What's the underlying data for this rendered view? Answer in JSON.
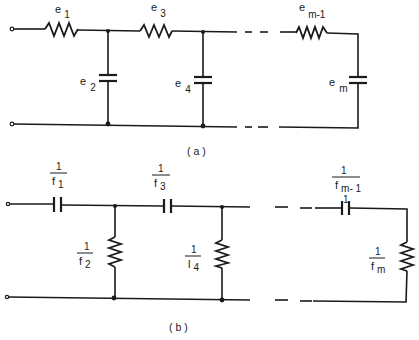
{
  "figure": {
    "part_a": {
      "caption": "( a )",
      "description": "Ladder network: series resistors, shunt capacitors",
      "elements": [
        {
          "id": "e1",
          "type": "resistor",
          "position": "series",
          "symbol": "e",
          "subscript": "1"
        },
        {
          "id": "e2",
          "type": "capacitor",
          "position": "shunt",
          "symbol": "e",
          "subscript": "2"
        },
        {
          "id": "e3",
          "type": "resistor",
          "position": "series",
          "symbol": "e",
          "subscript": "3"
        },
        {
          "id": "e4",
          "type": "capacitor",
          "position": "shunt",
          "symbol": "e",
          "subscript": "4"
        },
        {
          "id": "em-1",
          "type": "resistor",
          "position": "series",
          "symbol": "e",
          "subscript": "m-1"
        },
        {
          "id": "em",
          "type": "capacitor",
          "position": "shunt",
          "symbol": "e",
          "subscript": "m"
        }
      ]
    },
    "part_b": {
      "caption": "( b )",
      "description": "Dual ladder network: series capacitors, shunt resistors",
      "elements": [
        {
          "id": "f1",
          "type": "capacitor",
          "position": "series",
          "numerator": "1",
          "symbol": "f",
          "subscript": "1"
        },
        {
          "id": "f2",
          "type": "resistor",
          "position": "shunt",
          "numerator": "1",
          "symbol": "f",
          "subscript": "2"
        },
        {
          "id": "f3",
          "type": "capacitor",
          "position": "series",
          "numerator": "1",
          "symbol": "f",
          "subscript": "3"
        },
        {
          "id": "f4",
          "type": "resistor",
          "position": "shunt",
          "numerator": "1",
          "symbol": "l",
          "subscript": "4"
        },
        {
          "id": "fm-1",
          "type": "capacitor",
          "position": "series",
          "numerator": "1",
          "symbol": "f",
          "subscript": "m- 1"
        },
        {
          "id": "fm",
          "type": "resistor",
          "position": "shunt",
          "numerator": "1",
          "symbol": "f",
          "subscript": "m"
        }
      ]
    }
  }
}
